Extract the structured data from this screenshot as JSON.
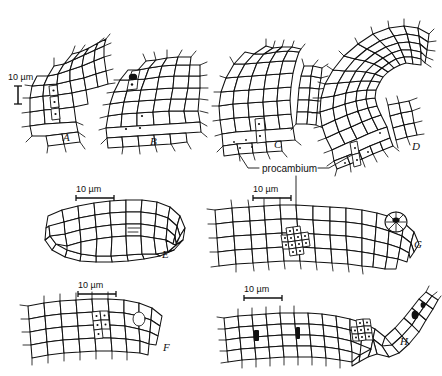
{
  "figure": {
    "background_color": "#ffffff",
    "ink_color": "#111111",
    "width": 442,
    "height": 376
  },
  "annotations": [
    {
      "id": "procambium-label",
      "text": "procambium",
      "x": 262,
      "y": 172
    }
  ],
  "scale_bars": [
    {
      "id": "scale-a",
      "label": "10 µm",
      "orientation": "vertical",
      "text_x": 8,
      "text_y": 80,
      "bar_x": 18,
      "bar_y1": 86,
      "bar_y2": 104,
      "length": 18
    },
    {
      "id": "scale-e",
      "label": "10 µm",
      "orientation": "horizontal",
      "text_x": 76,
      "text_y": 192,
      "bar_y": 198,
      "bar_x1": 76,
      "bar_x2": 114,
      "length": 38
    },
    {
      "id": "scale-g",
      "label": "10 µm",
      "orientation": "horizontal",
      "text_x": 253,
      "text_y": 192,
      "bar_y": 198,
      "bar_x1": 253,
      "bar_x2": 291,
      "length": 38
    },
    {
      "id": "scale-f",
      "label": "10 µm",
      "orientation": "horizontal",
      "text_x": 78,
      "text_y": 288,
      "bar_y": 294,
      "bar_x1": 78,
      "bar_x2": 116,
      "length": 38
    },
    {
      "id": "scale-h",
      "label": "10 µm",
      "orientation": "horizontal",
      "text_x": 244,
      "text_y": 292,
      "bar_y": 298,
      "bar_x1": 244,
      "bar_x2": 282,
      "length": 38
    }
  ],
  "panels": [
    {
      "id": "A",
      "letter": "A",
      "label_x": 63,
      "label_y": 141,
      "description": "early leaf primordium, longitudinal section, small bulge"
    },
    {
      "id": "B",
      "letter": "B",
      "label_x": 150,
      "label_y": 145,
      "description": "slightly older leaf primordium, longitudinal section"
    },
    {
      "id": "C",
      "letter": "C",
      "label_x": 274,
      "label_y": 148,
      "description": "elongating leaf primordium with procambial strand"
    },
    {
      "id": "D",
      "letter": "D",
      "label_x": 412,
      "label_y": 150,
      "description": "curved, elongated leaf primordium with long procambial file"
    },
    {
      "id": "E",
      "letter": "E",
      "label_x": 162,
      "label_y": 258,
      "description": "transverse section of primordium, oval outline"
    },
    {
      "id": "F",
      "letter": "F",
      "label_x": 163,
      "label_y": 351,
      "description": "tapered longitudinal section with procambium cells"
    },
    {
      "id": "G",
      "letter": "G",
      "label_x": 414,
      "label_y": 248,
      "description": "elongated longitudinal section with central procambium cluster"
    },
    {
      "id": "H",
      "letter": "H",
      "label_x": 400,
      "label_y": 345,
      "description": "hook-shaped longitudinal section with procambium strand"
    }
  ],
  "leader_lines": [
    {
      "id": "leader-to-c",
      "from": "procambium-label",
      "to_panel": "C"
    },
    {
      "id": "leader-to-d",
      "from": "procambium-label",
      "to_panel": "D"
    },
    {
      "id": "leader-to-g",
      "from": "procambium-label",
      "to_panel": "G"
    }
  ]
}
